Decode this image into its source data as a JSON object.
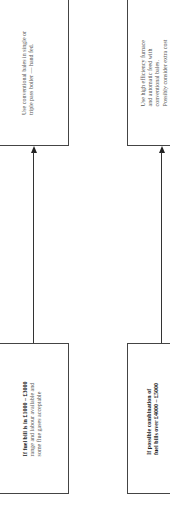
{
  "diagram": {
    "type": "flowchart",
    "orientation": "rotated-90-ccw",
    "nodes": [
      {
        "id": "outcome_left",
        "lines": [
          "Use conventional bales in single or",
          "triple pass boiler — hand fed."
        ]
      },
      {
        "id": "outcome_right",
        "lines": [
          "Use high efficiency furnace",
          "and automatic feed with",
          "conventional bales.",
          "Possibly consider extra cost"
        ]
      },
      {
        "id": "condition_left",
        "heading": "If fuel bill is in £1000 – £3000",
        "lines": [
          "range and labour available and",
          "some flue gases acceptable"
        ]
      },
      {
        "id": "condition_right",
        "heading_lines": [
          "If possible combination of",
          "fuel bills over £4000 – £5000"
        ]
      }
    ],
    "edges": [
      {
        "from": "condition_left",
        "to": "outcome_left"
      },
      {
        "from": "condition_right",
        "to": "outcome_right"
      }
    ],
    "colors": {
      "line": "#333333",
      "border": "#444444",
      "background": "#ffffff"
    }
  }
}
